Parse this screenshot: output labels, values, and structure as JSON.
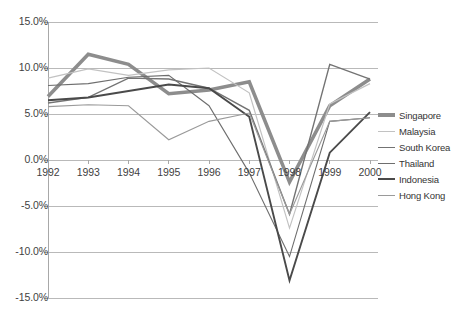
{
  "chart_data": {
    "type": "line",
    "title": "",
    "subtitle": "",
    "xlabel": "",
    "ylabel": "",
    "categories": [
      "1992",
      "1993",
      "1994",
      "1995",
      "1996",
      "1997",
      "1998",
      "1999",
      "2000"
    ],
    "x": [
      1992,
      1993,
      1994,
      1995,
      1996,
      1997,
      1998,
      1999,
      2000
    ],
    "ylim": [
      -15.0,
      15.0
    ],
    "ytick_values": [
      15.0,
      10.0,
      5.0,
      0.0,
      -5.0,
      -10.0,
      -15.0
    ],
    "ytick_labels": [
      "15.0%",
      "10.0%",
      "5.0%",
      "0.0%",
      "-5.0%",
      "-10.0%",
      "-15.0%"
    ],
    "grid": true,
    "grid_axis": "y",
    "legend_position": "right",
    "value_unit": "percent",
    "series": [
      {
        "name": "Singapore",
        "color": "#8d8d8d",
        "width": 3.6,
        "values": [
          6.9,
          11.5,
          10.4,
          7.2,
          7.6,
          8.5,
          -2.4,
          5.9,
          8.8
        ]
      },
      {
        "name": "Malaysia",
        "color": "#c2c2c2",
        "width": 1.2,
        "values": [
          8.9,
          9.9,
          9.2,
          9.8,
          10.0,
          7.3,
          -7.4,
          6.1,
          8.3
        ]
      },
      {
        "name": "South Korea",
        "color": "#737373",
        "width": 1.4,
        "values": [
          6.2,
          6.8,
          8.9,
          8.8,
          7.8,
          5.4,
          -5.9,
          10.4,
          8.8
        ]
      },
      {
        "name": "Thailand",
        "color": "#6e6e6e",
        "width": 1.1,
        "values": [
          8.1,
          8.3,
          9.0,
          9.2,
          5.9,
          -1.4,
          -10.5,
          4.2,
          4.6
        ]
      },
      {
        "name": "Indonesia",
        "color": "#4a4a4a",
        "width": 1.9,
        "values": [
          6.5,
          6.8,
          7.5,
          8.2,
          7.8,
          4.7,
          -13.1,
          0.8,
          5.2
        ]
      },
      {
        "name": "Hong Kong",
        "color": "#9a9a9a",
        "width": 1.1,
        "values": [
          5.8,
          6.0,
          5.9,
          2.2,
          4.2,
          5.1,
          -5.9,
          4.2,
          4.6
        ]
      }
    ]
  },
  "legend": {
    "items": [
      {
        "label": "Singapore"
      },
      {
        "label": "Malaysia"
      },
      {
        "label": "South Korea"
      },
      {
        "label": "Thailand"
      },
      {
        "label": "Indonesia"
      },
      {
        "label": "Hong Kong"
      }
    ]
  },
  "style": {
    "gridline_color": "#b9b9b9",
    "axis_color": "#a8a8a8",
    "text_color": "#3f3f3f",
    "background": "#ffffff"
  }
}
